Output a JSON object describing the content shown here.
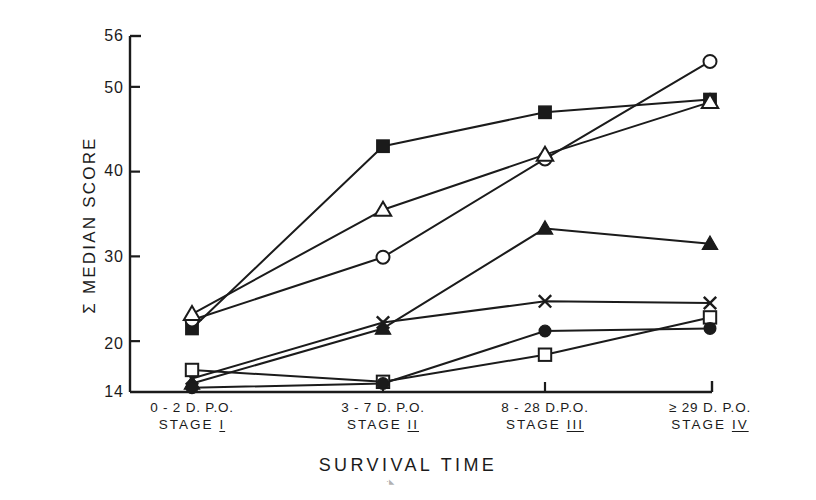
{
  "chart_data": {
    "type": "line",
    "title": "",
    "xlabel": "SURVIVAL TIME",
    "ylabel": "Σ MEDIAN SCORE",
    "categories": [
      "0 - 2 D. P.O.",
      "3 - 7 D. P.O.",
      "8 - 28 D.P.O.",
      "≥ 29 D. P.O."
    ],
    "category_sublabels": [
      "STAGE I",
      "STAGE II",
      "STAGE III",
      "STAGE IV"
    ],
    "ylim": [
      14,
      56
    ],
    "yticks": [
      14,
      20,
      30,
      40,
      50,
      56
    ],
    "ytick_labels": [
      "14",
      "20",
      "30",
      "40",
      "50",
      "56"
    ],
    "grid": false,
    "legend": "none",
    "series": [
      {
        "name": "filled-square",
        "marker": "filled-square",
        "values": [
          21.5,
          43.0,
          47.0,
          48.5
        ]
      },
      {
        "name": "open-circle",
        "marker": "open-circle",
        "values": [
          22.5,
          29.9,
          41.5,
          53.0
        ]
      },
      {
        "name": "open-triangle",
        "marker": "open-triangle",
        "values": [
          23.2,
          35.5,
          42.0,
          48.2
        ]
      },
      {
        "name": "filled-triangle",
        "marker": "filled-triangle",
        "values": [
          15.0,
          21.5,
          33.3,
          31.5
        ]
      },
      {
        "name": "cross-x",
        "marker": "cross-x",
        "values": [
          15.6,
          22.2,
          24.7,
          24.5
        ]
      },
      {
        "name": "open-square",
        "marker": "open-square",
        "values": [
          16.6,
          15.2,
          18.4,
          22.8
        ]
      },
      {
        "name": "filled-circle",
        "marker": "filled-circle",
        "values": [
          14.5,
          15.0,
          21.2,
          21.5
        ]
      }
    ]
  },
  "axis": {
    "y_tick_labels": [
      "56",
      "50",
      "40",
      "30",
      "20",
      "14"
    ],
    "x_categories": [
      {
        "line1": "0 - 2 D. P.O.",
        "stage_word": "STAGE",
        "stage_roman": "I"
      },
      {
        "line1": "3 - 7 D. P.O.",
        "stage_word": "STAGE",
        "stage_roman": "II"
      },
      {
        "line1": "8 - 28 D.P.O.",
        "stage_word": "STAGE",
        "stage_roman": "III"
      },
      {
        "line1": "≥ 29 D. P.O.",
        "stage_word": "STAGE",
        "stage_roman": "IV"
      }
    ]
  },
  "labels": {
    "y_axis_title": "Σ MEDIAN SCORE",
    "x_axis_title": "SURVIVAL TIME"
  },
  "colors": {
    "ink": "#1b1b1b",
    "background": "#ffffff"
  }
}
